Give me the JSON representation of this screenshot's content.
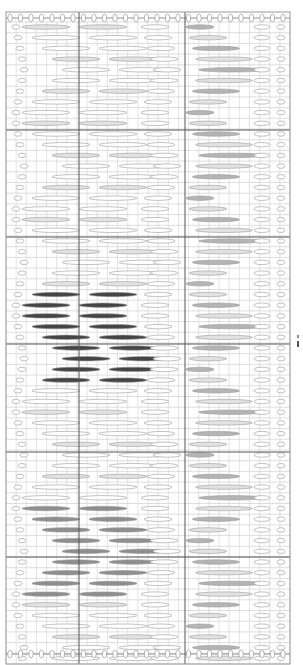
{
  "diagram": {
    "type": "knitting-stitch-chart",
    "frame": {
      "x": 6,
      "y": 12,
      "w": 284,
      "h": 652
    },
    "grid": {
      "cols": 28,
      "row_height": 10.7,
      "minor_color": "#c8c8c8",
      "major_color": "#555555",
      "major_x": [
        79,
        185
      ],
      "major_y": [
        130,
        237,
        344,
        452,
        557
      ]
    },
    "colors": {
      "background": "#ffffff",
      "outline": "#9a9a9a",
      "light_fill": "#e2e2e2",
      "mid_fill": "#b4b4b4",
      "dark_fill": "#444444",
      "grey_fill": "#8e8e8e"
    },
    "side_label": ""
  },
  "chart_data": {
    "type": "diagram",
    "title": "",
    "motifs": [
      {
        "name": "dark-chevron",
        "fill": "#444444",
        "rows_y": [
          296,
          307,
          318,
          329,
          340,
          351,
          362,
          373,
          383
        ]
      },
      {
        "name": "grey-chevron",
        "fill": "#8e8e8e",
        "rows_y": [
          510,
          521,
          532,
          543,
          553,
          564,
          575,
          586,
          596
        ]
      },
      {
        "name": "right-zigzag",
        "fill": "#b4b4b4"
      }
    ]
  }
}
